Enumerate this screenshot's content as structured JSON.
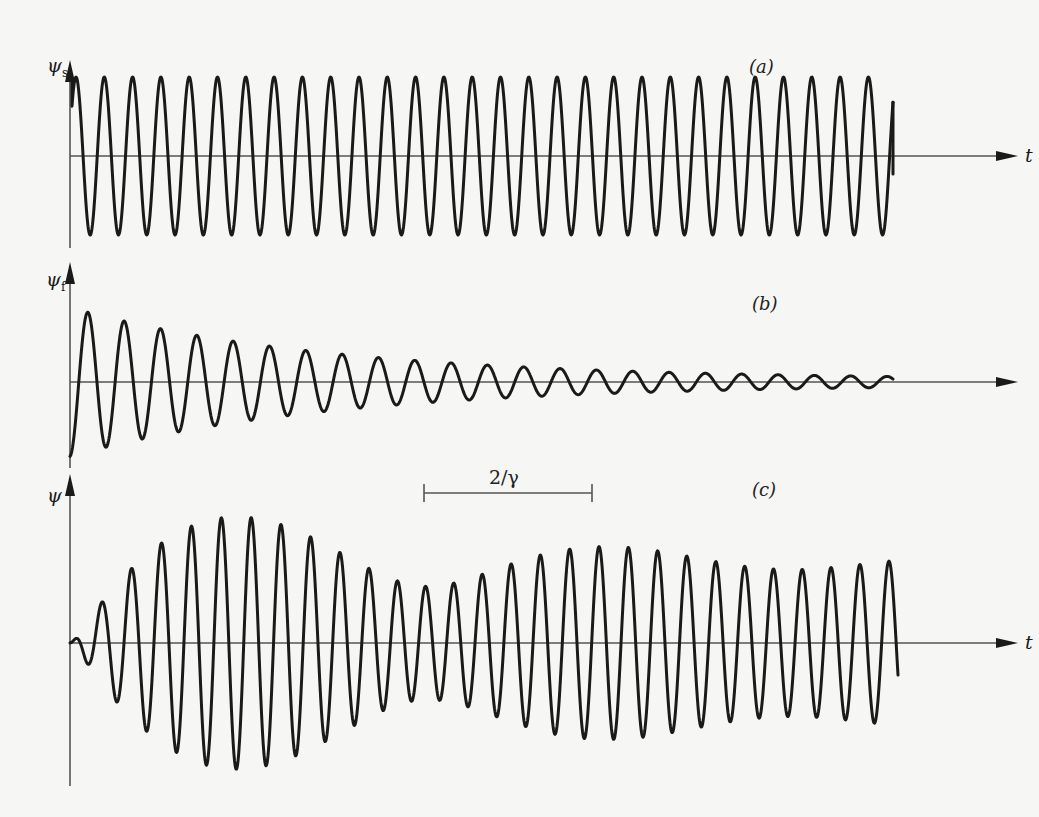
{
  "figure": {
    "panels": [
      {
        "id": "a",
        "panel_label": "(a)",
        "y_label_symbol": "ψ",
        "y_label_subscript": "s",
        "x_label": "t",
        "axis_y": 156,
        "y_axis_top": 62,
        "y_axis_bottom": 248,
        "x_start": 70,
        "x_axis_end": 1018,
        "curve": {
          "type": "steady",
          "x_start": 72,
          "x_end": 893,
          "period": 28.3,
          "amplitude": 79,
          "phase_start": "peak",
          "end_tail": 18
        }
      },
      {
        "id": "b",
        "panel_label": "(b)",
        "y_label_symbol": "ψ",
        "y_label_subscript": "f",
        "x_label": "",
        "axis_y": 382,
        "y_axis_top": 264,
        "y_axis_bottom": 468,
        "x_start": 70,
        "x_axis_end": 1018,
        "curve": {
          "type": "decaying",
          "x_start": 70,
          "x_end": 893,
          "period": 35.6,
          "amplitude": 72,
          "decay_px": 260,
          "phase_start": "trough"
        }
      },
      {
        "id": "c",
        "panel_label": "(c)",
        "y_label_symbol": "ψ",
        "y_label_subscript": "",
        "x_label": "t",
        "axis_y": 643,
        "y_axis_top": 476,
        "y_axis_bottom": 786,
        "x_start": 70,
        "x_axis_end": 1018,
        "curve": {
          "type": "sum",
          "x_start": 70,
          "x_end": 898
        }
      }
    ],
    "scale_bar": {
      "label": "2/γ",
      "x1": 424,
      "x2": 592,
      "y": 493
    }
  },
  "chart_data": {
    "type": "line",
    "title": "",
    "xlabel": "t",
    "scale_bar": "2/γ",
    "series": [
      {
        "name": "ψs",
        "panel": "(a)",
        "form": "constant-amplitude sinusoid",
        "cycles_visible": 29,
        "relative_amplitude": 1.0
      },
      {
        "name": "ψf",
        "panel": "(b)",
        "form": "exponentially decaying sinusoid",
        "cycles_visible": 23,
        "initial_relative_amplitude": 0.9,
        "starts_at": "negative extreme"
      },
      {
        "name": "ψ",
        "panel": "(c)",
        "form": "beating superposition decaying to steady state",
        "cycles_visible": 30,
        "peak_relative_amplitude": 1.6
      }
    ],
    "grid": false,
    "legend": "none"
  }
}
